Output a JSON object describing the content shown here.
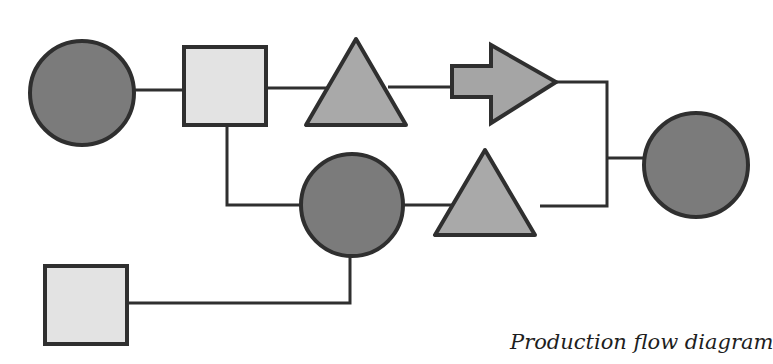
{
  "caption": "Production flow diagram",
  "colors": {
    "stroke": "#2f2f2f",
    "circle_fill": "#7b7b7b",
    "square_fill": "#e3e3e3",
    "triangle_fill": "#a9a9a9",
    "arrow_fill": "#a5a5a5",
    "background": "#ffffff"
  },
  "nodes": [
    {
      "id": "circle-1",
      "shape": "circle",
      "cx": 82,
      "cy": 93,
      "r": 52
    },
    {
      "id": "square-1",
      "shape": "square",
      "x": 184,
      "y": 47,
      "w": 82,
      "h": 78
    },
    {
      "id": "triangle-1",
      "shape": "triangle",
      "points": "356,39 306,125 406,125"
    },
    {
      "id": "arrow-1",
      "shape": "arrow",
      "points": "452,66 491,66 491,45 556,82 491,123 491,97 452,97"
    },
    {
      "id": "circle-2",
      "shape": "circle",
      "cx": 352,
      "cy": 205,
      "r": 51
    },
    {
      "id": "triangle-2",
      "shape": "triangle",
      "points": "485,150 435,235 535,235"
    },
    {
      "id": "circle-3",
      "shape": "circle",
      "cx": 696,
      "cy": 165,
      "r": 52
    },
    {
      "id": "square-2",
      "shape": "square",
      "x": 45,
      "y": 266,
      "w": 82,
      "h": 78
    }
  ],
  "connectors": [
    {
      "id": "circle1-to-square1",
      "points": "134,90 184,90"
    },
    {
      "id": "square1-to-triangle1",
      "points": "266,88 328,88"
    },
    {
      "id": "triangle1-to-arrow1",
      "points": "388,87 452,87"
    },
    {
      "id": "arrow1-to-junction",
      "points": "556,82 607,82 607,206 540,206"
    },
    {
      "id": "junction-to-circle3",
      "points": "607,158 644,158"
    },
    {
      "id": "square1-to-circle2",
      "points": "227,125 227,205 301,205"
    },
    {
      "id": "circle2-to-triangle2",
      "points": "403,205 455,205"
    },
    {
      "id": "circle2-to-square2",
      "points": "350,256 350,303 127,303"
    }
  ]
}
